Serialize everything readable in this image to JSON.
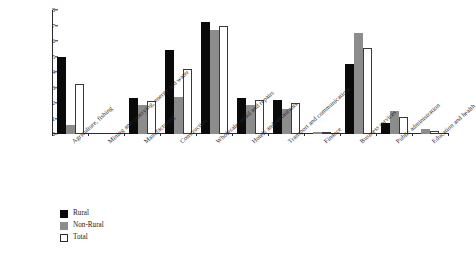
{
  "chart_data": {
    "type": "bar",
    "title": "",
    "xlabel": "",
    "ylabel": "",
    "ylim": [
      0,
      8
    ],
    "yticks": [
      "0",
      "1",
      "2",
      "3",
      "4",
      "5",
      "6",
      "7",
      "8"
    ],
    "grid": false,
    "legend_position": "bottom-left",
    "categories": [
      "Agriculture, fishing",
      "Mining and quarrying, energy and water",
      "Manufacturing",
      "Construction",
      "Wholesale, retail and repairs",
      "Hotels and restaurants",
      "Transport and communications",
      "Finance",
      "Business services",
      "Public administration",
      "Education and health"
    ],
    "series": [
      {
        "name": "Rural",
        "color": "#0a0a0a",
        "values": [
          5.0,
          0.0,
          2.3,
          5.4,
          7.25,
          2.3,
          2.2,
          0.0,
          4.5,
          0.7,
          0.0
        ]
      },
      {
        "name": "Non-Rural",
        "color": "#8c8c8c",
        "values": [
          0.55,
          0.0,
          1.9,
          2.4,
          6.7,
          1.85,
          1.6,
          0.15,
          6.5,
          1.5,
          0.3
        ]
      },
      {
        "name": "Total",
        "color": "#ffffff",
        "values": [
          3.25,
          0.0,
          2.1,
          4.2,
          7.0,
          2.2,
          2.0,
          0.15,
          5.55,
          1.1,
          0.2
        ]
      }
    ]
  },
  "legend": {
    "items": [
      {
        "label": "Rural",
        "swatch": "rural"
      },
      {
        "label": "Non-Rural",
        "swatch": "nonrural"
      },
      {
        "label": "Total",
        "swatch": "total"
      }
    ]
  }
}
